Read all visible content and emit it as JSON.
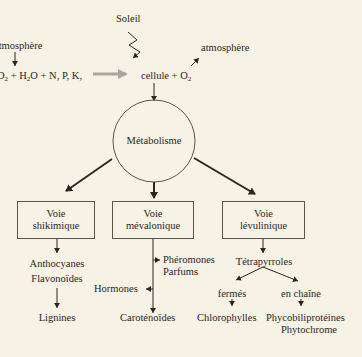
{
  "top": {
    "sun_label": "Soleil",
    "atmosphere_left": "atmosphère",
    "inputs": "O₂ + H₂O + N, P, K,",
    "inputs_parts": {
      "co2": "O",
      "sub2": "2",
      "rest": " + H",
      "sub_h2o": "2",
      "rest2": "O + N, P, K,"
    },
    "cell_output": "cellule + O",
    "o2_sub": "2",
    "atmosphere_right": "atmosphère"
  },
  "center": {
    "label": "Métabolisme"
  },
  "pathways": [
    {
      "line1": "Voie",
      "line2": "shikimique",
      "products": [
        "Anthocyanes",
        "Flavonoïdes"
      ],
      "final": "Lignines"
    },
    {
      "line1": "Voie",
      "line2": "mévalonique",
      "side_right": [
        "Phéromones",
        "Parfums"
      ],
      "side_left": "Hormones",
      "final": "Caroténoïdes"
    },
    {
      "line1": "Voie",
      "line2": "lévulinique",
      "product": "Tétrapyrroles",
      "branches": [
        {
          "label": "fermés",
          "final": [
            "Chlorophylles"
          ]
        },
        {
          "label": "en chaîne",
          "final": [
            "Phycobiliprotéines",
            "Phytochrome"
          ]
        }
      ]
    }
  ],
  "colors": {
    "background": "#f6f2e6",
    "ink": "#2b2622",
    "grey_arrow": "#a9a69f"
  }
}
